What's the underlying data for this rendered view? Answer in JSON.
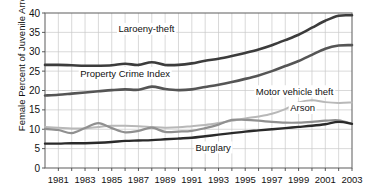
{
  "chart_data": {
    "type": "line",
    "title": "",
    "xlabel": "",
    "ylabel": "Female Percent of Juvenile Arrests",
    "ylim": [
      0,
      40
    ],
    "xlim": [
      1980,
      2003
    ],
    "grid": true,
    "legend": "inline-annotations",
    "ytick_labels": [
      "0",
      "5",
      "10",
      "15",
      "20",
      "25",
      "30",
      "35",
      "40"
    ],
    "ytick_values": [
      0,
      5,
      10,
      15,
      20,
      25,
      30,
      35,
      40
    ],
    "xtick_labels": [
      "1981",
      "1983",
      "1985",
      "1987",
      "1989",
      "1991",
      "1993",
      "1995",
      "1997",
      "1999",
      "2001",
      "2003"
    ],
    "xtick_values": [
      1981,
      1983,
      1985,
      1987,
      1989,
      1991,
      1993,
      1995,
      1997,
      1999,
      2001,
      2003
    ],
    "x": [
      1980,
      1981,
      1982,
      1983,
      1984,
      1985,
      1986,
      1987,
      1988,
      1989,
      1990,
      1991,
      1992,
      1993,
      1994,
      1995,
      1996,
      1997,
      1998,
      1999,
      2000,
      2001,
      2002,
      2003
    ],
    "series": [
      {
        "name": "Laroeny-theft",
        "color": "#3c3c3c",
        "width": 2.6,
        "label_x": 1987.6,
        "label_y": 35.0,
        "values": [
          26.6,
          26.6,
          26.5,
          26.4,
          26.4,
          26.5,
          26.9,
          26.6,
          27.3,
          26.6,
          26.6,
          27.0,
          27.7,
          28.2,
          28.9,
          29.7,
          30.6,
          31.7,
          33.0,
          34.4,
          36.2,
          38.0,
          39.3,
          39.4
        ]
      },
      {
        "name": "Property Crime Index",
        "color": "#555555",
        "width": 2.6,
        "label_x": 1986.0,
        "label_y": 23.6,
        "values": [
          18.7,
          18.9,
          19.2,
          19.5,
          19.8,
          20.1,
          20.3,
          20.2,
          21.0,
          20.4,
          20.1,
          20.3,
          20.9,
          21.5,
          22.2,
          23.0,
          23.9,
          25.0,
          26.3,
          27.6,
          29.2,
          30.8,
          31.6,
          31.7
        ]
      },
      {
        "name": "Motor vehicle theft",
        "color": "#b8b8b8",
        "width": 2.0,
        "label_x": 1998.7,
        "label_y": 18.9,
        "values": [
          10.6,
          10.4,
          10.2,
          10.2,
          10.6,
          10.9,
          10.9,
          10.8,
          10.6,
          10.4,
          10.5,
          10.8,
          11.1,
          11.6,
          12.2,
          12.8,
          13.3,
          14.0,
          15.2,
          16.9,
          17.5,
          17.0,
          16.8,
          16.9
        ]
      },
      {
        "name": "Arson",
        "color": "#909090",
        "width": 2.2,
        "label_x": 1999.3,
        "label_y": 14.6,
        "values": [
          10.1,
          9.8,
          9.0,
          10.3,
          11.6,
          10.3,
          9.2,
          9.6,
          10.4,
          9.3,
          9.4,
          9.6,
          10.3,
          11.2,
          12.4,
          12.4,
          12.2,
          11.9,
          11.7,
          11.7,
          11.9,
          12.2,
          12.3,
          11.4
        ]
      },
      {
        "name": "Burglary",
        "color": "#2a2a2a",
        "width": 2.4,
        "label_x": 1992.6,
        "label_y": 4.4,
        "values": [
          6.3,
          6.3,
          6.4,
          6.4,
          6.5,
          6.7,
          7.0,
          7.1,
          7.2,
          7.4,
          7.6,
          7.8,
          8.2,
          8.6,
          9.0,
          9.4,
          9.7,
          10.0,
          10.3,
          10.6,
          10.9,
          11.3,
          11.9,
          11.4
        ]
      }
    ]
  }
}
